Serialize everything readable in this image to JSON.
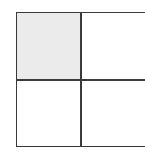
{
  "diagram": {
    "type": "2x2 grid",
    "rows": 2,
    "cols": 2,
    "cells": [
      {
        "row": 0,
        "col": 0,
        "shaded": true,
        "fill": "#ebebeb"
      },
      {
        "row": 0,
        "col": 1,
        "shaded": false,
        "fill": "#ffffff"
      },
      {
        "row": 1,
        "col": 0,
        "shaded": false,
        "fill": "#ffffff"
      },
      {
        "row": 1,
        "col": 1,
        "shaded": false,
        "fill": "#ffffff"
      }
    ],
    "line_color": "#3a3a3a"
  }
}
